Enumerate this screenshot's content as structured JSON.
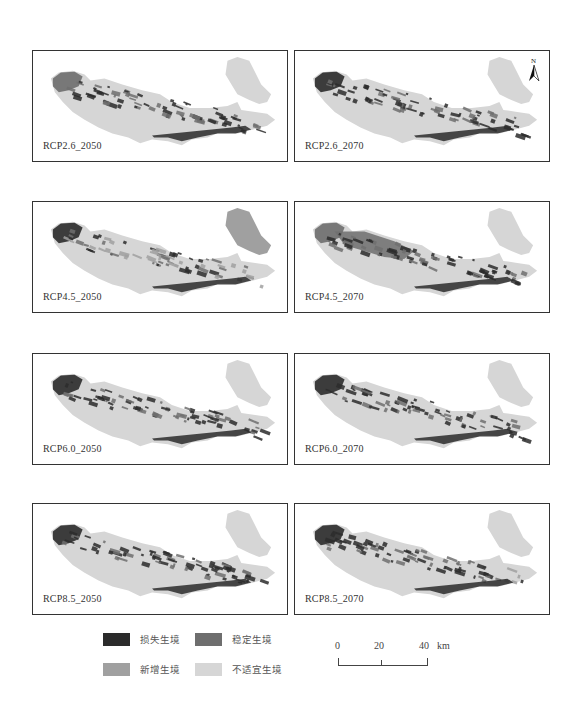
{
  "figure": {
    "panels": [
      {
        "id": "rcp26_2050",
        "label": "RCP2.6_2050",
        "x": 32,
        "y": 50,
        "variant": "a"
      },
      {
        "id": "rcp26_2070",
        "label": "RCP2.6_2070",
        "x": 294,
        "y": 50,
        "variant": "b",
        "north_arrow": true
      },
      {
        "id": "rcp45_2050",
        "label": "RCP4.5_2050",
        "x": 32,
        "y": 201,
        "variant": "c"
      },
      {
        "id": "rcp45_2070",
        "label": "RCP4.5_2070",
        "x": 294,
        "y": 201,
        "variant": "d"
      },
      {
        "id": "rcp60_2050",
        "label": "RCP6.0_2050",
        "x": 32,
        "y": 353,
        "variant": "b"
      },
      {
        "id": "rcp60_2070",
        "label": "RCP6.0_2070",
        "x": 294,
        "y": 353,
        "variant": "b"
      },
      {
        "id": "rcp85_2050",
        "label": "RCP8.5_2050",
        "x": 32,
        "y": 503,
        "variant": "b"
      },
      {
        "id": "rcp85_2070",
        "label": "RCP8.5_2070",
        "x": 294,
        "y": 503,
        "variant": "e"
      }
    ],
    "north_label": "N",
    "legend": {
      "items": [
        {
          "label": "损失生境",
          "color": "#2b2b2b"
        },
        {
          "label": "稳定生境",
          "color": "#6e6e6e"
        },
        {
          "label": "新增生境",
          "color": "#a0a0a0"
        },
        {
          "label": "不适宜生境",
          "color": "#d6d6d6"
        }
      ]
    },
    "scale_bar": {
      "ticks": [
        "0",
        "20",
        "40"
      ],
      "unit": "km"
    }
  }
}
